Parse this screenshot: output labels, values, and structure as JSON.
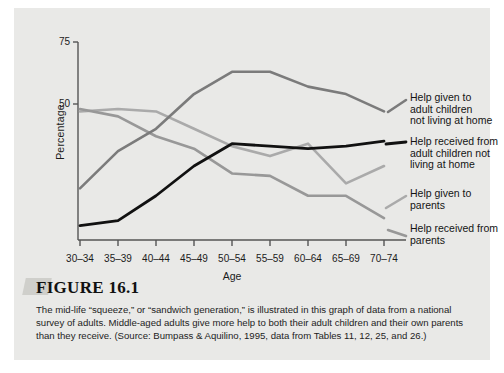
{
  "figure": {
    "number_label": "FIGURE 16.1",
    "caption": "The mid-life “squeeze,” or “sandwich generation,” is illustrated in this graph of data from a national survey of adults. Middle-aged adults give more help to both their adult children and their own parents than they receive. (Source: Bumpass & Aquilino, 1995, data from Tables 11, 12, 25, and 26.)"
  },
  "chart_data": {
    "type": "line",
    "title": "",
    "xlabel": "Age",
    "ylabel": "Percentage",
    "categories": [
      "30–34",
      "35–39",
      "40–44",
      "45–49",
      "50–54",
      "55–59",
      "60–64",
      "65–69",
      "70–74"
    ],
    "ylim": [
      0,
      75
    ],
    "yticks": [
      50,
      75
    ],
    "ytick_labels": [
      "50",
      "75"
    ],
    "grid": false,
    "legend_position": "right",
    "series": [
      {
        "name": "Help given to adult children not living at home",
        "color": "#7b7b7b",
        "width": 2.6,
        "values": [
          16,
          31,
          40,
          54,
          63,
          63,
          57,
          54,
          47
        ]
      },
      {
        "name": "Help received from adult children not living at home",
        "color": "#111111",
        "width": 2.8,
        "values": [
          1,
          3,
          13,
          25,
          34,
          33,
          32,
          33,
          35
        ]
      },
      {
        "name": "Help given to parents",
        "color": "#aaaaaa",
        "width": 2.6,
        "values": [
          47,
          48,
          47,
          40,
          33,
          29,
          34,
          18,
          25
        ]
      },
      {
        "name": "Help received from parents",
        "color": "#989898",
        "width": 2.6,
        "values": [
          48,
          45,
          37,
          32,
          22,
          21,
          13,
          13,
          4
        ]
      }
    ],
    "legend_labels": [
      [
        "Help given to",
        "adult children",
        "not living at home"
      ],
      [
        "Help received from",
        "adult children not",
        "living at home"
      ],
      [
        "Help given to",
        "parents"
      ],
      [
        "Help received from",
        "parents"
      ]
    ]
  }
}
